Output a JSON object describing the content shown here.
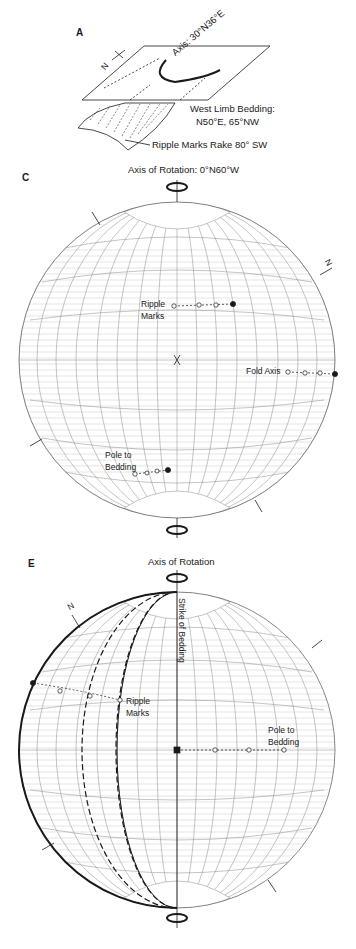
{
  "panel_a": {
    "label": "A",
    "axis_label": "Axis: 30°N36°E",
    "bedding_title": "West Limb Bedding:",
    "bedding_value": "N50°E, 65°NW",
    "ripple_label": "Ripple Marks Rake 80° SW",
    "north_symbol": "N"
  },
  "panel_c": {
    "label": "C",
    "axis_title": "Axis of Rotation: 0°N60°W",
    "ripple_label_1": "Ripple",
    "ripple_label_2": "Marks",
    "fold_axis_label": "Fold Axis",
    "pole_label_1": "Pole to",
    "pole_label_2": "Bedding",
    "north_symbol": "N"
  },
  "panel_e": {
    "label": "E",
    "axis_title": "Axis of Rotation",
    "strike_label": "Strike of Bedding",
    "ripple_label_1": "Ripple",
    "ripple_label_2": "Marks",
    "pole_label_1": "Pole to",
    "pole_label_2": "Bedding",
    "north_symbol": "N"
  },
  "colors": {
    "ink": "#1a1a1a",
    "grid": "#8a8a8a",
    "grid_fine": "#b5b5b5"
  }
}
